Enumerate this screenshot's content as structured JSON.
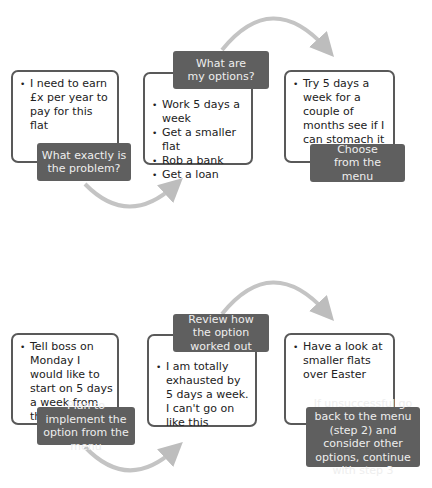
{
  "row1": {
    "steps": [
      {
        "label": "What exactly is the problem?",
        "bullets": [
          "I need to earn £x per year to pay for this flat"
        ]
      },
      {
        "label": "What are my options?",
        "bullets": [
          "Work 5 days a week",
          "Get a smaller flat",
          "Rob a bank",
          "Get a loan"
        ]
      },
      {
        "label": "Choose from the menu",
        "bullets": [
          "Try 5 days a week for a couple of months see if I can stomach it"
        ]
      }
    ]
  },
  "row2": {
    "steps": [
      {
        "label": "Plan to implement the option from the menu",
        "bullets": [
          "Tell boss on Monday I would like to start on 5 days a week from the New Year"
        ]
      },
      {
        "label": "Review how the option worked out",
        "bullets": [
          "I am totally exhausted by 5 days a week. I can't go on like this"
        ]
      },
      {
        "label": "If  unsuccessful go back to the menu (step 2) and consider other options, continue with step 3",
        "bullets": [
          "Have a look at smaller flats over Easter"
        ]
      }
    ]
  },
  "colors": {
    "label_bg": "#5f5f5f",
    "border": "#595959",
    "arrow": "#bdbdbd"
  }
}
